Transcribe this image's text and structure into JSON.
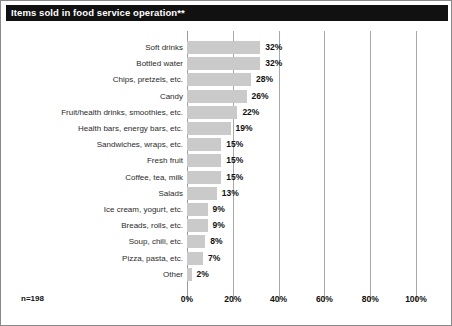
{
  "chart_data": {
    "type": "bar",
    "orientation": "horizontal",
    "title": "Items sold in food service operation**",
    "xlabel": "",
    "ylabel": "",
    "xlim": [
      0,
      100
    ],
    "xticks": [
      "0%",
      "20%",
      "40%",
      "60%",
      "80%",
      "100%"
    ],
    "xtick_values": [
      0,
      20,
      40,
      60,
      80,
      100
    ],
    "grid": true,
    "legend": "none",
    "sample_size": "n=198",
    "value_suffix": "%",
    "categories": [
      "Soft drinks",
      "Bottled water",
      "Chips, pretzels, etc.",
      "Candy",
      "Fruit/health drinks, smoothies, etc.",
      "Health bars, energy bars, etc.",
      "Sandwiches, wraps, etc.",
      "Fresh fruit",
      "Coffee, tea, milk",
      "Salads",
      "Ice cream, yogurt, etc.",
      "Breads, rolls, etc.",
      "Soup, chili, etc.",
      "Pizza, pasta, etc.",
      "Other"
    ],
    "values": [
      32,
      32,
      28,
      26,
      22,
      19,
      15,
      15,
      15,
      13,
      9,
      9,
      8,
      7,
      2
    ],
    "value_labels": [
      "32%",
      "32%",
      "28%",
      "26%",
      "22%",
      "19%",
      "15%",
      "15%",
      "15%",
      "13%",
      "9%",
      "9%",
      "8%",
      "7%",
      "2%"
    ],
    "colors": {
      "bar_fill": "#cacaca",
      "title_background": "#111111",
      "title_text": "#ffffff",
      "gridline": "#a8a8a8",
      "label_text": "#2b2b2b",
      "value_text": "#111111",
      "border": "#8a8a8a",
      "background": "#ffffff"
    }
  }
}
